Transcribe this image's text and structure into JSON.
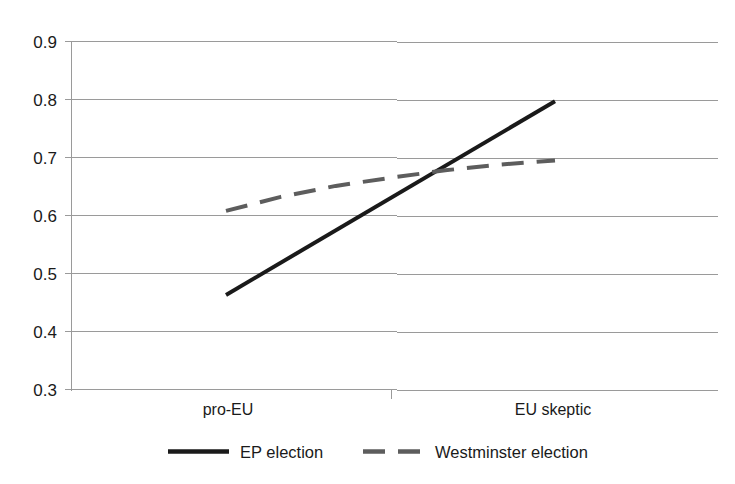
{
  "chart_data": {
    "type": "line",
    "title": "",
    "xlabel": "",
    "ylabel": "",
    "categories": [
      "pro-EU",
      "EU skeptic"
    ],
    "x": [
      0,
      1
    ],
    "ylim": [
      0.3,
      0.9
    ],
    "yticks": [
      "0.3",
      "0.4",
      "0.5",
      "0.6",
      "0.7",
      "0.8",
      "0.9"
    ],
    "ytick_values": [
      0.3,
      0.4,
      0.5,
      0.6,
      0.7,
      0.8,
      0.9
    ],
    "grid": true,
    "legend_position": "bottom",
    "series": [
      {
        "name": "EP election",
        "values": [
          0.463,
          0.797
        ],
        "style": "solid",
        "color": "#1a1a1a",
        "width": 4
      },
      {
        "name": "Westminster election",
        "values": [
          0.608,
          0.695
        ],
        "style": "dashed",
        "color": "#5d5d5d",
        "width": 4,
        "curved": true,
        "midpoints": [
          0.632,
          0.651,
          0.665,
          0.678,
          0.688
        ]
      }
    ]
  },
  "axes": {
    "y_labels": {
      "t0": "0.9",
      "t1": "0.8",
      "t2": "0.7",
      "t3": "0.6",
      "t4": "0.5",
      "t5": "0.4",
      "t6": "0.3"
    },
    "x_labels": {
      "left": "pro-EU",
      "right": "EU skeptic"
    }
  },
  "legend": {
    "items": {
      "first": "EP election",
      "second": "Westminster election"
    }
  }
}
